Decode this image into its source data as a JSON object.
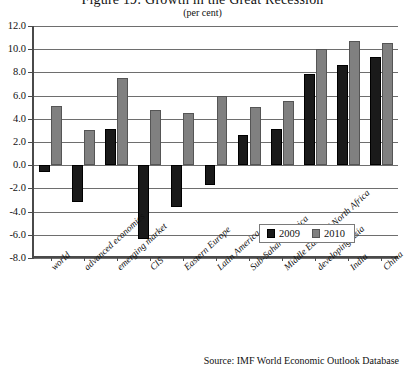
{
  "chart_data": {
    "type": "bar",
    "title": "Figure 19: Growth in the Great Recession",
    "subtitle": "(per cent)",
    "xlabel": "",
    "ylabel": "",
    "ylim": [
      -8.0,
      12.0
    ],
    "ytick_step": 2.0,
    "yticks": [
      "12.0",
      "10.0",
      "8.0",
      "6.0",
      "4.0",
      "2.0",
      "0.0",
      "-2.0",
      "-4.0",
      "-6.0",
      "-8.0"
    ],
    "grid": true,
    "legend_position": "inside-bottom-right",
    "categories": [
      "world",
      "advanced economies",
      "emerging market",
      "CIS",
      "Eastern Europe",
      "Latin America",
      "Sub-Saharan Africa",
      "Middle East and North Africa",
      "developing Asia",
      "India",
      "China"
    ],
    "series": [
      {
        "name": "2009",
        "color": "#1a1a1a",
        "values": [
          -0.6,
          -3.2,
          3.1,
          -6.4,
          -3.6,
          -1.7,
          2.6,
          3.1,
          7.9,
          8.6,
          9.3
        ]
      },
      {
        "name": "2010",
        "color": "#808080",
        "values": [
          5.1,
          3.0,
          7.5,
          4.8,
          4.5,
          6.0,
          5.0,
          5.5,
          10.0,
          10.7,
          10.5
        ]
      }
    ],
    "source": "Source: IMF World Economic Outlook Database"
  },
  "legend": {
    "items": [
      {
        "label": "2009"
      },
      {
        "label": "2010"
      }
    ]
  }
}
